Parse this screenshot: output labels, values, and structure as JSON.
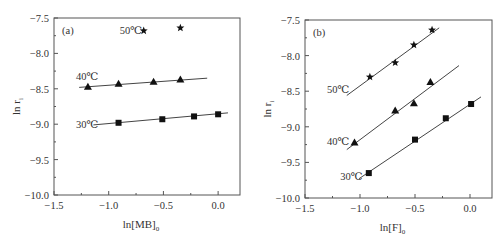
{
  "chart_data": [
    {
      "type": "scatter",
      "panel_label": "(a)",
      "title": "",
      "xlabel": "ln[MB]0",
      "xlabel_main": "ln[MB]",
      "xlabel_sub": "0",
      "ylabel": "ln r_i",
      "ylabel_main": "ln r",
      "ylabel_sub": "i",
      "xlim": [
        -1.5,
        0.2
      ],
      "ylim": [
        -10.0,
        -7.5
      ],
      "xticks": [
        "-1.5",
        "-1.0",
        "-0.5",
        "0.0"
      ],
      "xtick_values": [
        -1.5,
        -1.0,
        -0.5,
        0.0
      ],
      "yticks": [
        "-7.5",
        "-8.0",
        "-8.5",
        "-9.0",
        "-9.5",
        "-10.0"
      ],
      "ytick_values": [
        -7.5,
        -8.0,
        -8.5,
        -9.0,
        -9.5,
        -10.0
      ],
      "grid": false,
      "series": [
        {
          "name": "50℃",
          "marker": "star",
          "x": [
            -0.68,
            -0.345
          ],
          "y": [
            -7.68,
            -7.64
          ],
          "fit_line": null,
          "label_pos": [
            -0.9,
            -7.72
          ]
        },
        {
          "name": "40℃",
          "marker": "triangle",
          "x": [
            -1.19,
            -0.91,
            -0.59,
            -0.345
          ],
          "y": [
            -8.47,
            -8.43,
            -8.4,
            -8.37
          ],
          "fit_line": [
            [
              -1.27,
              -8.48
            ],
            [
              -0.1,
              -8.35
            ]
          ],
          "label_pos": [
            -1.3,
            -8.38
          ]
        },
        {
          "name": "30℃",
          "marker": "square",
          "x": [
            -0.91,
            -0.51,
            -0.22,
            0.0
          ],
          "y": [
            -8.98,
            -8.93,
            -8.89,
            -8.86
          ],
          "fit_line": [
            [
              -1.14,
              -9.01
            ],
            [
              0.09,
              -8.84
            ]
          ],
          "label_pos": [
            -1.3,
            -9.05
          ]
        }
      ]
    },
    {
      "type": "scatter",
      "panel_label": "(b)",
      "title": "",
      "xlabel": "ln[F]0",
      "xlabel_main": "ln[F]",
      "xlabel_sub": "0",
      "ylabel": "ln r_i",
      "ylabel_main": "ln r",
      "ylabel_sub": "i",
      "xlim": [
        -1.5,
        0.2
      ],
      "ylim": [
        -10.0,
        -7.5
      ],
      "xticks": [
        "-1.5",
        "-1.0",
        "-0.5",
        "0.0"
      ],
      "xtick_values": [
        -1.5,
        -1.0,
        -0.5,
        0.0
      ],
      "yticks": [
        "-7.5",
        "-8.0",
        "-8.5",
        "-9.0",
        "-9.5",
        "-10.0"
      ],
      "ytick_values": [
        -7.5,
        -8.0,
        -8.5,
        -9.0,
        -9.5,
        -10.0
      ],
      "grid": false,
      "series": [
        {
          "name": "50℃",
          "marker": "star",
          "x": [
            -0.91,
            -0.68,
            -0.51,
            -0.345
          ],
          "y": [
            -8.3,
            -8.1,
            -7.85,
            -7.64
          ],
          "fit_line": [
            [
              -1.12,
              -8.56
            ],
            [
              -0.28,
              -7.61
            ]
          ],
          "label_pos": [
            -1.3,
            -8.52
          ]
        },
        {
          "name": "40℃",
          "marker": "triangle",
          "x": [
            -1.05,
            -0.68,
            -0.51,
            -0.36
          ],
          "y": [
            -9.22,
            -8.77,
            -8.67,
            -8.37
          ],
          "fit_line": [
            [
              -1.12,
              -9.32
            ],
            [
              -0.1,
              -8.14
            ]
          ],
          "label_pos": [
            -1.3,
            -9.25
          ]
        },
        {
          "name": "30℃",
          "marker": "square",
          "x": [
            -0.92,
            -0.5,
            -0.22,
            0.01
          ],
          "y": [
            -9.65,
            -9.18,
            -8.88,
            -8.68
          ],
          "fit_line": [
            [
              -1.01,
              -9.73
            ],
            [
              0.1,
              -8.58
            ]
          ],
          "label_pos": [
            -1.18,
            -9.75
          ]
        }
      ]
    }
  ]
}
